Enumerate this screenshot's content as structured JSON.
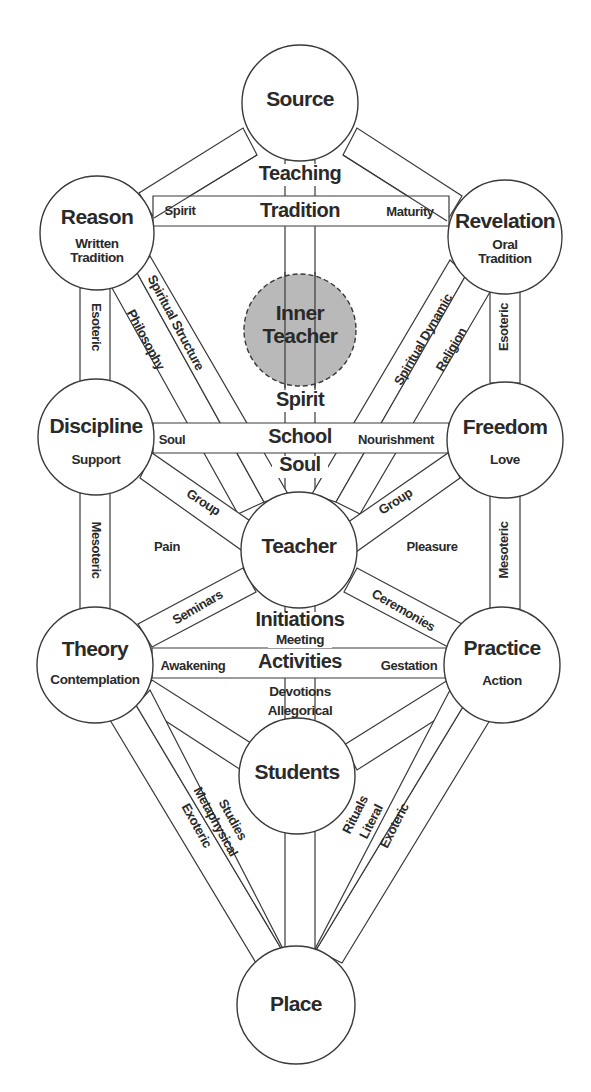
{
  "diagram": {
    "colors": {
      "stroke": "#3a3a3a",
      "text": "#2a2a2a",
      "inner_teacher_fill": "#b9b9b9",
      "background": "#ffffff"
    },
    "nodes": {
      "source": {
        "title": "Source",
        "subtitle": ""
      },
      "reason": {
        "title": "Reason",
        "subtitle_line1": "Written",
        "subtitle_line2": "Tradition"
      },
      "revelation": {
        "title": "Revelation",
        "subtitle_line1": "Oral",
        "subtitle_line2": "Tradition"
      },
      "inner_teacher": {
        "line1": "Inner",
        "line2": "Teacher"
      },
      "discipline": {
        "title": "Discipline",
        "subtitle": "Support"
      },
      "freedom": {
        "title": "Freedom",
        "subtitle": "Love"
      },
      "teacher": {
        "title": "Teacher"
      },
      "theory": {
        "title": "Theory",
        "subtitle": "Contemplation"
      },
      "practice": {
        "title": "Practice",
        "subtitle": "Action"
      },
      "students": {
        "title": "Students"
      },
      "place": {
        "title": "Place"
      }
    },
    "central_labels": {
      "teaching": "Teaching",
      "tradition": "Tradition",
      "spirit": "Spirit",
      "school": "School",
      "soul": "Soul",
      "initiations": "Initiations",
      "meeting": "Meeting",
      "activities": "Activities",
      "devotions": "Devotions",
      "allegorical": "Allegorical"
    },
    "path_labels": {
      "tradition_left": "Spirit",
      "tradition_right": "Maturity",
      "school_left": "Soul",
      "school_right": "Nourishment",
      "activities_left": "Awakening",
      "activities_right": "Gestation",
      "reason_discipline": "Esoteric",
      "revelation_freedom": "Esoteric",
      "discipline_theory": "Mesoteric",
      "freedom_practice": "Mesoteric",
      "reason_teacher_outer": "Spiritual Structure",
      "reason_teacher_inner": "Philosophy",
      "revelation_teacher_outer": "Spiritual Dynamic",
      "revelation_teacher_inner": "Religion",
      "discipline_teacher": "Group",
      "freedom_teacher": "Group",
      "pain": "Pain",
      "pleasure": "Pleasure",
      "theory_teacher": "Seminars",
      "practice_teacher": "Ceremonies",
      "theory_place_outer": "Exoteric",
      "theory_place_inner": "Metaphysical",
      "theory_students": "Studies",
      "practice_place_outer": "Exoteric",
      "practice_place_inner": "Literal",
      "practice_students": "Rituals"
    }
  }
}
